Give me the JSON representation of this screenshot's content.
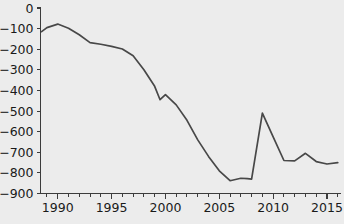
{
  "chart_data": {
    "type": "line",
    "title": "",
    "subtitle": "",
    "xlabel": "",
    "ylabel": "",
    "xlim": [
      1988.4,
      2016.3
    ],
    "ylim": [
      -900,
      0
    ],
    "grid": false,
    "legend": null,
    "yticks": [
      0,
      -100,
      -200,
      -300,
      -400,
      -500,
      -600,
      -700,
      -800,
      -900
    ],
    "ytick_labels": [
      "0",
      "−100",
      "−200",
      "−300",
      "−400",
      "−500",
      "−600",
      "−700",
      "−800",
      "−900"
    ],
    "xticks_major": [
      1990,
      1995,
      2000,
      2005,
      2010,
      2015
    ],
    "xtick_labels": [
      "1990",
      "1995",
      "2000",
      "2005",
      "2010",
      "2015"
    ],
    "xticks_minor": [
      1989,
      1991,
      1992,
      1993,
      1994,
      1996,
      1997,
      1998,
      1999,
      2001,
      2002,
      2003,
      2004,
      2006,
      2007,
      2008,
      2009,
      2011,
      2012,
      2013,
      2014,
      2016
    ],
    "line_color": "#484848",
    "axis_color": "#3c3c3c",
    "background_color": "#ececec",
    "series": [
      {
        "name": "series-1",
        "x": [
          1988.5,
          1989,
          1990,
          1991,
          1992,
          1993,
          1994,
          1995,
          1996,
          1997,
          1998,
          1999,
          1999.5,
          2000,
          2001,
          2002,
          2003,
          2004,
          2005,
          2006,
          2007,
          2007.6,
          2008,
          2009,
          2010,
          2011,
          2012,
          2013,
          2014,
          2015,
          2016
        ],
        "values": [
          -115,
          -95,
          -78,
          -98,
          -130,
          -168,
          -176,
          -186,
          -199,
          -232,
          -300,
          -380,
          -445,
          -420,
          -470,
          -545,
          -640,
          -720,
          -790,
          -838,
          -826,
          -828,
          -830,
          -510,
          -625,
          -740,
          -742,
          -705,
          -745,
          -757,
          -750
        ]
      }
    ]
  }
}
